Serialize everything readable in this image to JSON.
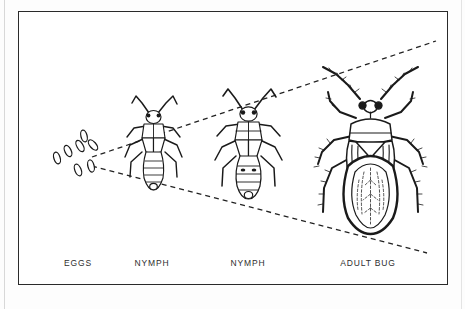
{
  "figure": {
    "kind": "life-cycle-diagram",
    "partial_top_caption": "",
    "frame_color": "#2a2a2a",
    "ink_color": "#1a1a1a",
    "background_color": "#ffffff"
  },
  "labels": {
    "eggs": "EGGS",
    "nymph_first": "NYMPH",
    "nymph_second": "NYMPH",
    "adult": "ADULT BUG"
  },
  "stages": [
    {
      "id": "eggs",
      "label": "EGGS",
      "label_x": 78,
      "egg_count": 7
    },
    {
      "id": "nymph-1",
      "label": "NYMPH",
      "label_x": 152
    },
    {
      "id": "nymph-2",
      "label": "NYMPH",
      "label_x": 248
    },
    {
      "id": "adult-bug",
      "label": "ADULT BUG",
      "label_x": 368
    }
  ],
  "guides": {
    "style": "dashed",
    "description": "two dashed guide lines fanning right from the egg cluster to the adult bug",
    "upper": {
      "x1": 92,
      "y1": 157,
      "x2": 436,
      "y2": 41
    },
    "lower": {
      "x1": 92,
      "y1": 166,
      "x2": 427,
      "y2": 253
    }
  },
  "label_row_y": 262
}
